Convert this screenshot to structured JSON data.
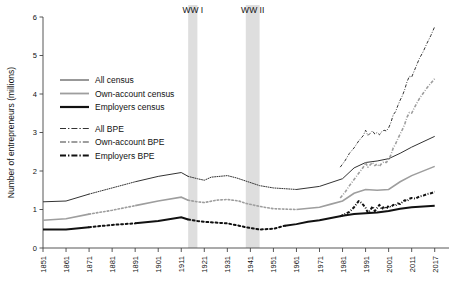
{
  "chart_data": {
    "type": "line",
    "title": "",
    "xlabel": "",
    "ylabel": "Number of entrepreneurs (millions)",
    "xlim": [
      1851,
      2017
    ],
    "ylim": [
      0,
      6
    ],
    "yticks": [
      0,
      1,
      2,
      3,
      4,
      5,
      6
    ],
    "xticks": [
      1851,
      1861,
      1871,
      1881,
      1891,
      1901,
      1911,
      1921,
      1931,
      1941,
      1951,
      1961,
      1971,
      1981,
      1991,
      2001,
      2011,
      2017
    ],
    "grid": false,
    "legend_position": "upper-left-inside",
    "annotations": [
      {
        "label": "WW I",
        "x_start": 1914,
        "x_end": 1918
      },
      {
        "label": "WW II",
        "x_start": 1939,
        "x_end": 1945
      }
    ],
    "series": [
      {
        "name": "All census",
        "color": "#333333",
        "style": "solid",
        "width": 1.0,
        "points": [
          [
            1851,
            1.2
          ],
          [
            1861,
            1.22
          ],
          [
            1871,
            1.4
          ],
          [
            1881,
            1.56
          ],
          [
            1891,
            1.72
          ],
          [
            1901,
            1.86
          ],
          [
            1911,
            1.96
          ],
          [
            1914,
            1.86
          ],
          [
            1918,
            1.8
          ],
          [
            1921,
            1.76
          ],
          [
            1924,
            1.84
          ],
          [
            1931,
            1.88
          ],
          [
            1935,
            1.82
          ],
          [
            1939,
            1.74
          ],
          [
            1945,
            1.62
          ],
          [
            1951,
            1.56
          ],
          [
            1961,
            1.52
          ],
          [
            1966,
            1.56
          ],
          [
            1971,
            1.6
          ],
          [
            1976,
            1.7
          ],
          [
            1981,
            1.8
          ],
          [
            1986,
            2.08
          ],
          [
            1991,
            2.22
          ],
          [
            1996,
            2.26
          ],
          [
            2001,
            2.32
          ],
          [
            2006,
            2.46
          ],
          [
            2011,
            2.62
          ],
          [
            2017,
            2.9
          ]
        ],
        "dotted_segments": [
          [
            1861,
            1881
          ],
          [
            1911,
            1951
          ]
        ]
      },
      {
        "name": "Own-account census",
        "color": "#9e9e9e",
        "style": "solid",
        "width": 1.6,
        "points": [
          [
            1851,
            0.72
          ],
          [
            1861,
            0.76
          ],
          [
            1871,
            0.88
          ],
          [
            1881,
            0.98
          ],
          [
            1891,
            1.1
          ],
          [
            1901,
            1.22
          ],
          [
            1911,
            1.32
          ],
          [
            1914,
            1.24
          ],
          [
            1918,
            1.2
          ],
          [
            1921,
            1.18
          ],
          [
            1926,
            1.24
          ],
          [
            1931,
            1.26
          ],
          [
            1936,
            1.22
          ],
          [
            1939,
            1.16
          ],
          [
            1945,
            1.08
          ],
          [
            1951,
            1.02
          ],
          [
            1961,
            1.0
          ],
          [
            1971,
            1.06
          ],
          [
            1976,
            1.14
          ],
          [
            1981,
            1.22
          ],
          [
            1986,
            1.42
          ],
          [
            1991,
            1.52
          ],
          [
            1996,
            1.5
          ],
          [
            2001,
            1.52
          ],
          [
            2006,
            1.72
          ],
          [
            2011,
            1.88
          ],
          [
            2017,
            2.12
          ]
        ],
        "dotted_segments": [
          [
            1861,
            1881
          ],
          [
            1911,
            1951
          ]
        ]
      },
      {
        "name": "Employers census",
        "color": "#111111",
        "style": "solid",
        "width": 2.0,
        "points": [
          [
            1851,
            0.48
          ],
          [
            1861,
            0.48
          ],
          [
            1871,
            0.54
          ],
          [
            1881,
            0.6
          ],
          [
            1891,
            0.64
          ],
          [
            1901,
            0.7
          ],
          [
            1911,
            0.8
          ],
          [
            1914,
            0.74
          ],
          [
            1918,
            0.7
          ],
          [
            1921,
            0.68
          ],
          [
            1926,
            0.66
          ],
          [
            1931,
            0.64
          ],
          [
            1936,
            0.58
          ],
          [
            1939,
            0.54
          ],
          [
            1945,
            0.48
          ],
          [
            1951,
            0.5
          ],
          [
            1956,
            0.58
          ],
          [
            1961,
            0.62
          ],
          [
            1966,
            0.68
          ],
          [
            1971,
            0.72
          ],
          [
            1976,
            0.78
          ],
          [
            1981,
            0.84
          ],
          [
            1986,
            0.88
          ],
          [
            1991,
            0.9
          ],
          [
            1996,
            0.92
          ],
          [
            2001,
            0.96
          ],
          [
            2006,
            1.02
          ],
          [
            2011,
            1.06
          ],
          [
            2017,
            1.1
          ]
        ],
        "dotted_segments": [
          [
            1861,
            1881
          ],
          [
            1911,
            1951
          ]
        ]
      },
      {
        "name": "All BPE",
        "color": "#333333",
        "style": "dashdot",
        "width": 1.0,
        "points": [
          [
            1980,
            2.1
          ],
          [
            1982,
            2.26
          ],
          [
            1984,
            2.46
          ],
          [
            1986,
            2.6
          ],
          [
            1988,
            2.78
          ],
          [
            1990,
            2.92
          ],
          [
            1991,
            3.06
          ],
          [
            1992,
            2.92
          ],
          [
            1993,
            2.98
          ],
          [
            1994,
            3.04
          ],
          [
            1995,
            2.96
          ],
          [
            1996,
            3.0
          ],
          [
            1997,
            2.94
          ],
          [
            1998,
            3.02
          ],
          [
            1999,
            3.06
          ],
          [
            2000,
            3.04
          ],
          [
            2001,
            3.12
          ],
          [
            2002,
            3.26
          ],
          [
            2003,
            3.46
          ],
          [
            2004,
            3.54
          ],
          [
            2005,
            3.7
          ],
          [
            2006,
            3.84
          ],
          [
            2007,
            3.96
          ],
          [
            2008,
            4.12
          ],
          [
            2009,
            4.32
          ],
          [
            2010,
            4.46
          ],
          [
            2011,
            4.44
          ],
          [
            2012,
            4.68
          ],
          [
            2013,
            4.92
          ],
          [
            2014,
            5.1
          ],
          [
            2015,
            5.32
          ],
          [
            2016,
            5.52
          ],
          [
            2017,
            5.75
          ]
        ]
      },
      {
        "name": "Own-account BPE",
        "color": "#9e9e9e",
        "style": "dashdot",
        "width": 1.6,
        "points": [
          [
            1980,
            1.3
          ],
          [
            1982,
            1.44
          ],
          [
            1984,
            1.62
          ],
          [
            1986,
            1.78
          ],
          [
            1988,
            1.94
          ],
          [
            1990,
            2.1
          ],
          [
            1991,
            2.22
          ],
          [
            1992,
            2.1
          ],
          [
            1993,
            2.16
          ],
          [
            1994,
            2.22
          ],
          [
            1995,
            2.14
          ],
          [
            1996,
            2.18
          ],
          [
            1997,
            2.12
          ],
          [
            1998,
            2.2
          ],
          [
            1999,
            2.24
          ],
          [
            2000,
            2.22
          ],
          [
            2001,
            2.3
          ],
          [
            2002,
            2.42
          ],
          [
            2003,
            2.6
          ],
          [
            2004,
            2.7
          ],
          [
            2005,
            2.84
          ],
          [
            2006,
            2.96
          ],
          [
            2007,
            3.08
          ],
          [
            2008,
            3.22
          ],
          [
            2009,
            3.4
          ],
          [
            2010,
            3.52
          ],
          [
            2011,
            3.5
          ],
          [
            2012,
            3.7
          ],
          [
            2013,
            3.88
          ],
          [
            2014,
            4.02
          ],
          [
            2015,
            4.16
          ],
          [
            2016,
            4.28
          ],
          [
            2017,
            4.4
          ]
        ]
      },
      {
        "name": "Employers BPE",
        "color": "#111111",
        "style": "dashdot",
        "width": 2.0,
        "points": [
          [
            1980,
            0.82
          ],
          [
            1982,
            0.88
          ],
          [
            1984,
            0.94
          ],
          [
            1986,
            1.06
          ],
          [
            1987,
            1.14
          ],
          [
            1988,
            1.22
          ],
          [
            1989,
            1.18
          ],
          [
            1990,
            1.12
          ],
          [
            1991,
            1.04
          ],
          [
            1992,
            0.92
          ],
          [
            1993,
            0.98
          ],
          [
            1994,
            1.08
          ],
          [
            1995,
            0.96
          ],
          [
            1996,
            1.04
          ],
          [
            1997,
            1.12
          ],
          [
            1998,
            1.0
          ],
          [
            1999,
            1.08
          ],
          [
            2000,
            1.02
          ],
          [
            2001,
            1.1
          ],
          [
            2002,
            1.06
          ],
          [
            2003,
            1.12
          ],
          [
            2004,
            1.1
          ],
          [
            2005,
            1.16
          ],
          [
            2006,
            1.14
          ],
          [
            2007,
            1.2
          ],
          [
            2008,
            1.24
          ],
          [
            2009,
            1.22
          ],
          [
            2010,
            1.28
          ],
          [
            2011,
            1.3
          ],
          [
            2012,
            1.28
          ],
          [
            2013,
            1.34
          ],
          [
            2014,
            1.36
          ],
          [
            2015,
            1.4
          ],
          [
            2016,
            1.42
          ],
          [
            2017,
            1.46
          ]
        ]
      }
    ]
  },
  "axis": {
    "ylabel": "Number of entrepreneurs (millions)",
    "ytick_labels": [
      "0",
      "1",
      "2",
      "3",
      "4",
      "5",
      "6"
    ],
    "xtick_labels": [
      "1851",
      "1861",
      "1871",
      "1881",
      "1891",
      "1901",
      "1911",
      "1921",
      "1931",
      "1941",
      "1951",
      "1961",
      "1971",
      "1981",
      "1991",
      "2001",
      "2011",
      "2017"
    ]
  },
  "annotations": {
    "ww1_label": "WW I",
    "ww2_label": "WW II"
  },
  "legend": {
    "group_census": [
      {
        "label": "All census",
        "color": "#333333",
        "style": "solid",
        "width": 1.0
      },
      {
        "label": "Own-account census",
        "color": "#9e9e9e",
        "style": "solid",
        "width": 1.8
      },
      {
        "label": "Employers census",
        "color": "#111111",
        "style": "solid",
        "width": 2.2
      }
    ],
    "group_bpe": [
      {
        "label": "All BPE",
        "color": "#333333",
        "style": "dashdot",
        "width": 1.0
      },
      {
        "label": "Own-account BPE",
        "color": "#9e9e9e",
        "style": "dashdot",
        "width": 1.8
      },
      {
        "label": "Employers BPE",
        "color": "#111111",
        "style": "dashdot",
        "width": 2.2
      }
    ]
  }
}
